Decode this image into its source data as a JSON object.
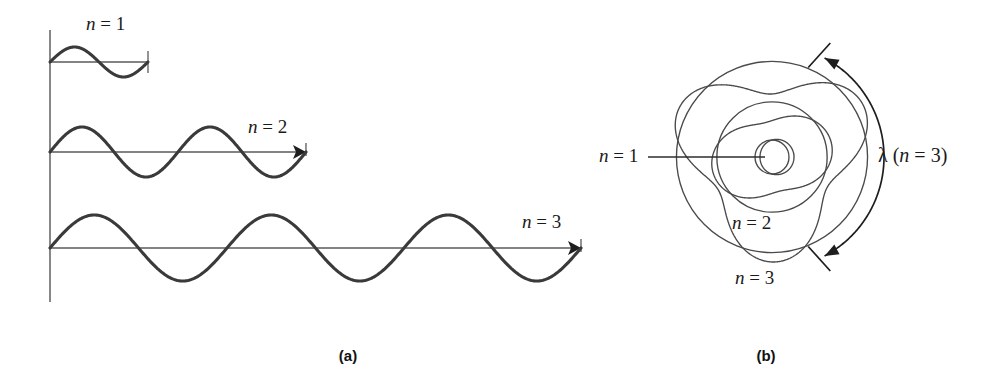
{
  "figure": {
    "background_color": "#ffffff",
    "wave_color": "#3a3a3a",
    "axis_color": "#555555",
    "orbit_color": "#4a4a4a",
    "label_color": "#1a1a1a"
  },
  "panel_a": {
    "caption": "(a)",
    "caption_x": 348,
    "caption_y": 361,
    "axis": {
      "x": 50,
      "y_top": 30,
      "y_bottom": 302
    },
    "waves": [
      {
        "label": "n = 1",
        "n": 1,
        "cycles": 1,
        "label_x": 86,
        "label_y": 30,
        "baseline_y": 62,
        "x_start": 50,
        "x_end": 148,
        "amplitude": 15,
        "end_marker": "tick"
      },
      {
        "label": "n = 2",
        "n": 2,
        "cycles": 2,
        "label_x": 248,
        "label_y": 133,
        "baseline_y": 152,
        "x_start": 50,
        "x_end": 306,
        "amplitude": 25,
        "end_marker": "arrow"
      },
      {
        "label": "n = 3",
        "n": 3,
        "cycles": 3,
        "label_x": 522,
        "label_y": 228,
        "baseline_y": 248,
        "x_start": 50,
        "x_end": 581,
        "amplitude": 33,
        "end_marker": "arrow"
      }
    ]
  },
  "panel_b": {
    "caption": "(b)",
    "caption_x": 766,
    "caption_y": 361,
    "center_x": 772,
    "center_y": 157,
    "orbits": [
      {
        "label": "n = 1",
        "n": 1,
        "radius": 17,
        "ripple": 5,
        "label_x": 599,
        "label_y": 162
      },
      {
        "label": "n = 2",
        "n": 2,
        "radius": 48,
        "ripple": 13,
        "label_x": 732,
        "label_y": 229
      },
      {
        "label": "n = 3",
        "n": 3,
        "radius": 84,
        "ripple": 21,
        "label_x": 735,
        "label_y": 284
      }
    ],
    "leader_n1": {
      "x1": 648,
      "y1": 157,
      "x2": 765,
      "y2": 157
    },
    "wavelength_annotation": {
      "symbol": "λ",
      "text": " (n = 3)",
      "full_text": "λ (n = 3)",
      "label_x": 878,
      "label_y": 162,
      "arc_radius": 112,
      "arc_start_angle": -62,
      "arc_end_angle": 62
    }
  }
}
